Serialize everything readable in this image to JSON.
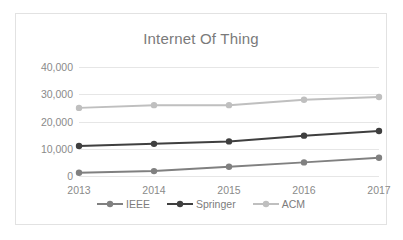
{
  "chart_data": {
    "type": "line",
    "title": "Internet Of Thing",
    "xlabel": "",
    "ylabel": "",
    "categories": [
      "2013",
      "2014",
      "2015",
      "2016",
      "2017"
    ],
    "ytick_labels": [
      "40,000",
      "30,000",
      "20,000",
      "10,000",
      "0"
    ],
    "yticks": [
      40000,
      30000,
      20000,
      10000,
      0
    ],
    "ylim": [
      0,
      40000
    ],
    "grid": true,
    "legend_position": "bottom",
    "series": [
      {
        "name": "IEEE",
        "color": "#808080",
        "values": [
          1200,
          1800,
          3400,
          5000,
          6700
        ]
      },
      {
        "name": "Springer",
        "color": "#3f3f3f",
        "values": [
          11000,
          11800,
          12700,
          14800,
          16500
        ]
      },
      {
        "name": "ACM",
        "color": "#bfbfbf",
        "values": [
          25000,
          26000,
          26000,
          28000,
          29000
        ]
      }
    ]
  },
  "style": {
    "title_color": "#7a7a7a",
    "tick_color": "#8a8a8a",
    "gridline_color": "#e6e6e6",
    "border_color": "#e2e2e2",
    "background": "#ffffff"
  }
}
